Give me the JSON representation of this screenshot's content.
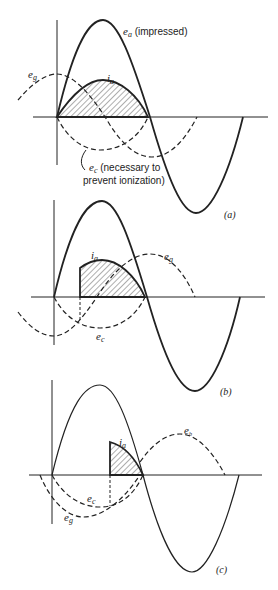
{
  "figure": {
    "panels": [
      {
        "id": "a",
        "caption": "(a)",
        "labels": {
          "ea": "e",
          "ea_sub": "a",
          "ea_note": " (impressed)",
          "eg": "e",
          "eg_sub": "g",
          "ia": "i",
          "ia_sub": "a",
          "ec": "e",
          "ec_sub": "c",
          "ec_note_1": " (necessary to",
          "ec_note_2": "prevent ionization)"
        }
      },
      {
        "id": "b",
        "caption": "(b)",
        "labels": {
          "ia": "i",
          "ia_sub": "a",
          "eg": "e",
          "eg_sub": "g",
          "ec": "e",
          "ec_sub": "c"
        }
      },
      {
        "id": "c",
        "caption": "(c)",
        "labels": {
          "ia": "i",
          "ia_sub": "a",
          "eb": "e",
          "eb_sub": "b",
          "ec": "e",
          "ec_sub": "c",
          "eg": "e",
          "eg_sub": "g"
        }
      }
    ],
    "colors": {
      "ink": "#222222",
      "background": "#ffffff"
    }
  }
}
